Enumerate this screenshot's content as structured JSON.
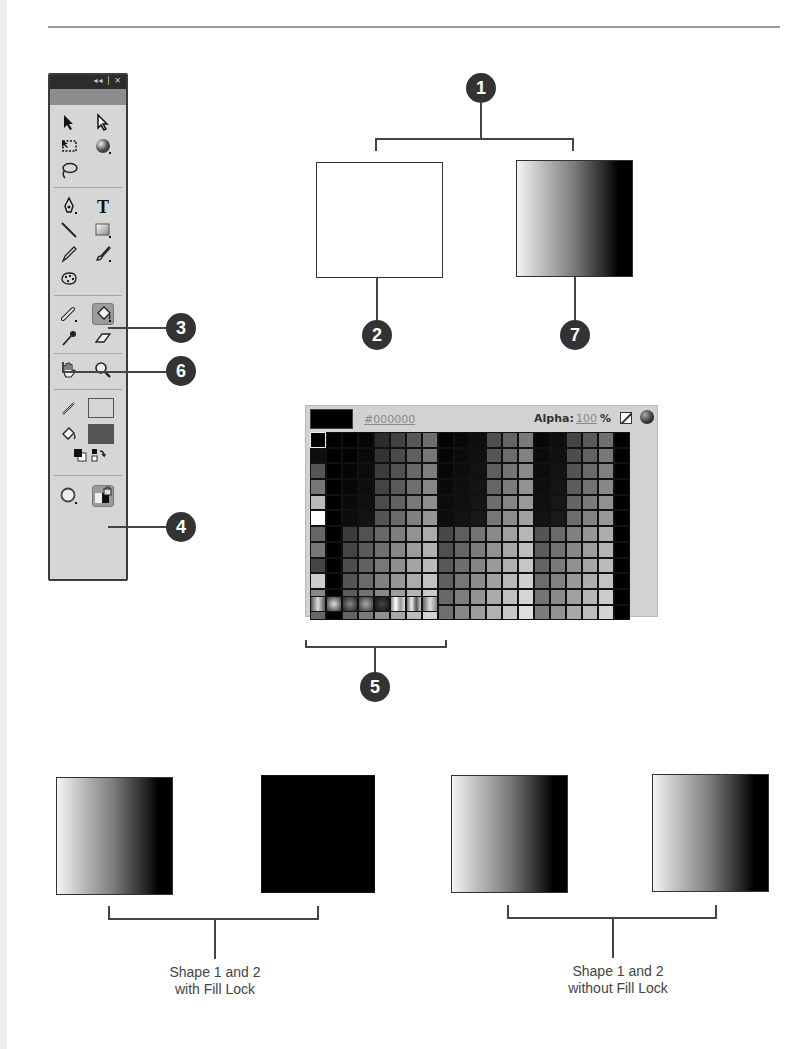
{
  "toolbox": {
    "title_controls": "◂◂ | ✕",
    "tools": [
      {
        "name": "selection-tool",
        "row": 0,
        "col": 0
      },
      {
        "name": "subselection-tool",
        "row": 0,
        "col": 1
      },
      {
        "name": "free-transform-tool",
        "row": 1,
        "col": 0
      },
      {
        "name": "3d-rotation-tool",
        "row": 1,
        "col": 1
      },
      {
        "name": "lasso-tool",
        "row": 2,
        "col": 0
      },
      {
        "name": "pen-tool",
        "row": 3,
        "col": 0
      },
      {
        "name": "text-tool",
        "row": 3,
        "col": 1
      },
      {
        "name": "line-tool",
        "row": 4,
        "col": 0
      },
      {
        "name": "rectangle-tool",
        "row": 4,
        "col": 1
      },
      {
        "name": "pencil-tool",
        "row": 5,
        "col": 0
      },
      {
        "name": "brush-tool",
        "row": 5,
        "col": 1
      },
      {
        "name": "deco-tool",
        "row": 6,
        "col": 0
      },
      {
        "name": "bone-tool",
        "row": 7,
        "col": 0
      },
      {
        "name": "paint-bucket-tool",
        "row": 7,
        "col": 1,
        "active": true
      },
      {
        "name": "eyedropper-tool",
        "row": 8,
        "col": 0
      },
      {
        "name": "eraser-tool",
        "row": 8,
        "col": 1
      },
      {
        "name": "hand-tool",
        "row": 9,
        "col": 0
      },
      {
        "name": "zoom-tool",
        "row": 9,
        "col": 1
      }
    ],
    "stroke_color": "#000000",
    "fill_color": "#555555",
    "options": {
      "object_drawing": "circle",
      "lock_fill": "lock-fill"
    }
  },
  "callouts": [
    {
      "number": "1",
      "x": 466,
      "y": 73
    },
    {
      "number": "2",
      "x": 362,
      "y": 320
    },
    {
      "number": "7",
      "x": 560,
      "y": 320
    },
    {
      "number": "3",
      "x": 166,
      "y": 313
    },
    {
      "number": "6",
      "x": 166,
      "y": 356
    },
    {
      "number": "4",
      "x": 166,
      "y": 512
    },
    {
      "number": "5",
      "x": 360,
      "y": 672
    }
  ],
  "palette": {
    "current_color": "#000000",
    "hex_value": "#000000",
    "alpha_label": "Alpha:",
    "alpha_value": "100",
    "alpha_unit": "%"
  },
  "captions": {
    "with_fill_lock": [
      "Shape 1 and 2",
      "with Fill Lock"
    ],
    "without_fill_lock": [
      "Shape 1 and 2",
      "without Fill Lock"
    ]
  }
}
